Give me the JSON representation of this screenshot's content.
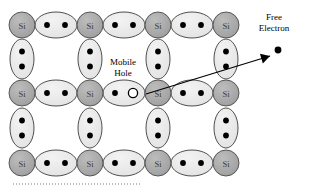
{
  "figure": {
    "type": "silicon-crystal-lattice-diagram",
    "background_color": "#ffffff"
  },
  "colors": {
    "atom_fill": "#a5a5a5",
    "atom_stroke": "#4a4a4a",
    "bond_fill": "#e9e9e9",
    "bond_stroke": "#3c3c3c",
    "electron_fill": "#000000",
    "hole_fill": "#ffffff",
    "hole_stroke": "#000000",
    "arrow_color": "#000000",
    "dotted_line_color": "#7a7a7a",
    "atom_label_color": "#3a3a3a"
  },
  "atom": {
    "label": "Si",
    "radius_x": 13,
    "radius_y": 13
  },
  "geometry": {
    "columns_x": [
      22,
      90,
      158,
      226
    ],
    "rows_y": [
      25,
      93,
      163
    ],
    "h_bond_rx": 21,
    "h_bond_ry": 13,
    "v_bond_rx": 12,
    "v_bond_ry": 20
  },
  "atoms": [
    {
      "id": "si-r0-c0",
      "x": 22,
      "y": 25,
      "label": "Si"
    },
    {
      "id": "si-r0-c1",
      "x": 90,
      "y": 25,
      "label": "Si"
    },
    {
      "id": "si-r0-c2",
      "x": 158,
      "y": 25,
      "label": "Si"
    },
    {
      "id": "si-r0-c3",
      "x": 226,
      "y": 25,
      "label": "Si"
    },
    {
      "id": "si-r1-c0",
      "x": 22,
      "y": 93,
      "label": "Si"
    },
    {
      "id": "si-r1-c1",
      "x": 90,
      "y": 93,
      "label": "Si"
    },
    {
      "id": "si-r1-c2",
      "x": 158,
      "y": 93,
      "label": "Si"
    },
    {
      "id": "si-r1-c3",
      "x": 226,
      "y": 93,
      "label": "Si"
    },
    {
      "id": "si-r2-c0",
      "x": 22,
      "y": 163,
      "label": "Si"
    },
    {
      "id": "si-r2-c1",
      "x": 90,
      "y": 163,
      "label": "Si"
    },
    {
      "id": "si-r2-c2",
      "x": 158,
      "y": 163,
      "label": "Si"
    },
    {
      "id": "si-r2-c3",
      "x": 226,
      "y": 163,
      "label": "Si"
    }
  ],
  "horizontal_bonds": [
    {
      "id": "hbond-r0-c0",
      "x": 56,
      "y": 25,
      "electrons": 2,
      "hole": false
    },
    {
      "id": "hbond-r0-c1",
      "x": 124,
      "y": 25,
      "electrons": 2,
      "hole": false
    },
    {
      "id": "hbond-r0-c2",
      "x": 192,
      "y": 25,
      "electrons": 2,
      "hole": false
    },
    {
      "id": "hbond-r1-c0",
      "x": 56,
      "y": 93,
      "electrons": 2,
      "hole": false
    },
    {
      "id": "hbond-r1-c1",
      "x": 124,
      "y": 93,
      "electrons": 1,
      "hole": true
    },
    {
      "id": "hbond-r1-c2",
      "x": 192,
      "y": 93,
      "electrons": 2,
      "hole": false
    },
    {
      "id": "hbond-r2-c0",
      "x": 56,
      "y": 163,
      "electrons": 2,
      "hole": false
    },
    {
      "id": "hbond-r2-c1",
      "x": 124,
      "y": 163,
      "electrons": 2,
      "hole": false
    },
    {
      "id": "hbond-r2-c2",
      "x": 192,
      "y": 163,
      "electrons": 2,
      "hole": false
    }
  ],
  "vertical_bonds": [
    {
      "id": "vbond-r0-c0",
      "x": 22,
      "y": 59,
      "electrons": 2
    },
    {
      "id": "vbond-r0-c1",
      "x": 90,
      "y": 59,
      "electrons": 2
    },
    {
      "id": "vbond-r0-c2",
      "x": 158,
      "y": 59,
      "electrons": 2
    },
    {
      "id": "vbond-r0-c3",
      "x": 226,
      "y": 59,
      "electrons": 2
    },
    {
      "id": "vbond-r1-c0",
      "x": 22,
      "y": 128,
      "electrons": 2
    },
    {
      "id": "vbond-r1-c1",
      "x": 90,
      "y": 128,
      "electrons": 2
    },
    {
      "id": "vbond-r1-c2",
      "x": 158,
      "y": 128,
      "electrons": 2
    },
    {
      "id": "vbond-r1-c3",
      "x": 226,
      "y": 128,
      "electrons": 2
    }
  ],
  "mobile_hole": {
    "label_line1": "Mobile",
    "label_line2": "Hole",
    "marker_x": 133,
    "marker_y": 93,
    "marker_radius": 4.6
  },
  "free_electron": {
    "label_line1": "Free",
    "label_line2": "Electron",
    "dot_x": 278,
    "dot_y": 50,
    "dot_radius": 3.4
  },
  "arrow": {
    "from_x": 146,
    "from_y": 94,
    "to_x": 270,
    "to_y": 56,
    "head_length": 9,
    "head_width": 5
  },
  "baseline_dotted": {
    "x_start": 13,
    "x_end": 141,
    "y": 184,
    "dash": "1 2"
  }
}
